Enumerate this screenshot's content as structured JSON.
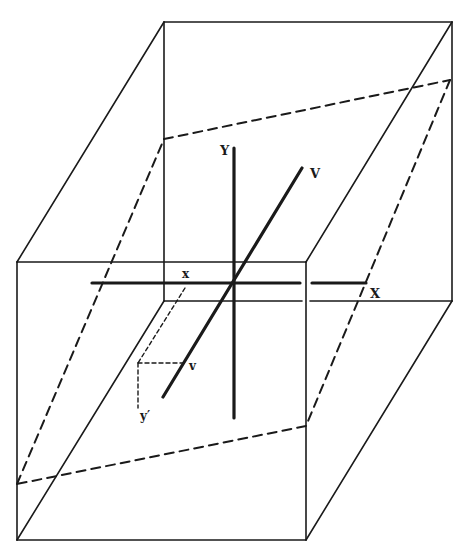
{
  "diagram": {
    "kind": "3D perspective box with axes and dashed oblique plane",
    "colors": {
      "stroke": "#1a1a1a",
      "background": "#ffffff"
    },
    "labels": {
      "Y": "Y",
      "V": "V",
      "X": "X",
      "x": "x",
      "v": "v",
      "y_prime": "y′"
    },
    "box": {
      "back_face": [
        [
          164,
          22
        ],
        [
          452,
          22
        ],
        [
          452,
          301
        ],
        [
          164,
          301
        ]
      ],
      "front_face": [
        [
          17,
          262
        ],
        [
          306,
          262
        ],
        [
          306,
          540
        ],
        [
          17,
          540
        ]
      ]
    },
    "dashed_plane": [
      [
        164,
        139
      ],
      [
        450,
        80
      ],
      [
        306,
        426
      ],
      [
        17,
        484
      ]
    ],
    "axes": {
      "X": {
        "from": [
          92,
          283
        ],
        "to": [
          366,
          283
        ]
      },
      "Y": {
        "from": [
          234,
          148
        ],
        "to": [
          234,
          418
        ]
      },
      "V": {
        "from": [
          163,
          397
        ],
        "to": [
          302,
          168
        ]
      }
    }
  }
}
